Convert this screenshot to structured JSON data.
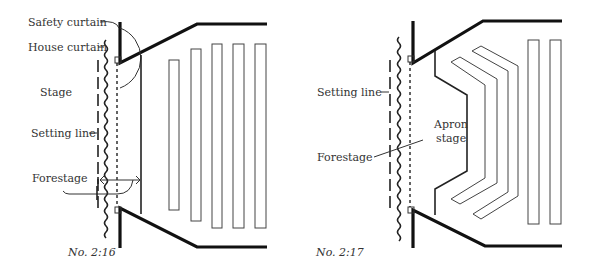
{
  "figures": [
    {
      "id": "left",
      "caption": "No. 2:16",
      "labels": {
        "safety_curtain": "Safety curtain",
        "house_curtain": "House curtain",
        "stage": "Stage",
        "setting_line": "Setting line",
        "forestage": "Forestage"
      }
    },
    {
      "id": "right",
      "caption": "No. 2:17",
      "labels": {
        "setting_line": "Setting line",
        "forestage": "Forestage",
        "apron_line1": "Apron",
        "apron_line2": "stage"
      }
    }
  ]
}
